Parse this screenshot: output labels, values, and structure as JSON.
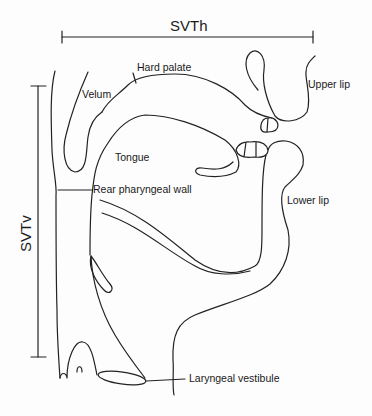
{
  "diagram": {
    "dimensions": {
      "horizontal": "SVTh",
      "vertical": "SVTv"
    },
    "labels": {
      "hard_palate": "Hard palate",
      "velum": "Velum",
      "upper_lip": "Upper lip",
      "tongue": "Tongue",
      "rear_pharyngeal_wall": "Rear pharyngeal wall",
      "lower_lip": "Lower lip",
      "laryngeal_vestibule": "Laryngeal vestibule"
    },
    "stroke_color": "#222222",
    "background": "#fdfdfd"
  }
}
